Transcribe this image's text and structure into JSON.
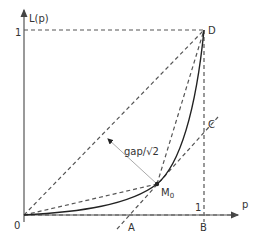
{
  "diagram": {
    "axes": {
      "y_label": "L(p)",
      "x_label": "p",
      "origin_label": "0",
      "y_tick_label": "1",
      "x_tick_label": "1"
    },
    "points": {
      "D": "D",
      "C": "C",
      "A": "A",
      "B": "B",
      "M0_main": "M",
      "M0_sub": "0"
    },
    "annotation": "gap/√2",
    "colors": {
      "line": "#555555",
      "curve": "#222222",
      "gap_arrow": "#aaaaaa",
      "text": "#333333"
    }
  }
}
